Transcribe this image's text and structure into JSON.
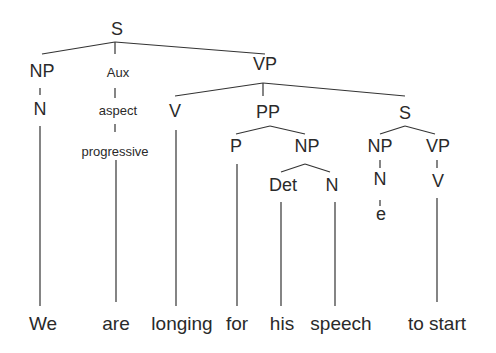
{
  "diagram": {
    "type": "syntax-tree",
    "sentence": "We are longing for his speech to start",
    "nodes": {
      "root_s": "S",
      "np": "NP",
      "n1": "N",
      "aux": "Aux",
      "aspect": "aspect",
      "progressive": "progressive",
      "vp": "VP",
      "v": "V",
      "pp": "PP",
      "p": "P",
      "np2": "NP",
      "det": "Det",
      "n2": "N",
      "s2": "S",
      "np3": "NP",
      "n3": "N",
      "e": "e",
      "vp2": "VP",
      "v2": "V"
    },
    "words": [
      "We",
      "are",
      "longing",
      "for",
      "his",
      "speech",
      "to start"
    ]
  },
  "colors": {
    "ink": "#2a2a2a",
    "background": "#ffffff"
  }
}
